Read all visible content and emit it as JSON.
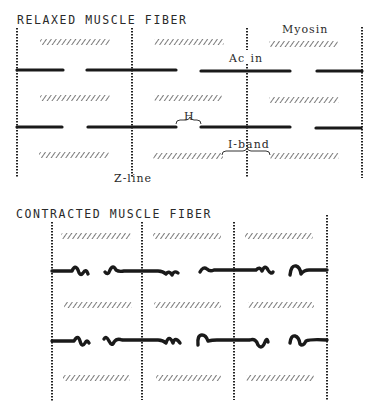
{
  "relaxed": {
    "title": "RELAXED MUSCLE FIBER",
    "labels": {
      "myosin": "Myosin",
      "actin": "Actin",
      "h_zone": "H",
      "i_band": "I-band",
      "z_line": "Z-line"
    }
  },
  "contracted": {
    "title": "CONTRACTED MUSCLE FIBER"
  },
  "colors": {
    "line": "#1a1a1a",
    "myosin_hatch": "#555555",
    "background": "#ffffff"
  }
}
